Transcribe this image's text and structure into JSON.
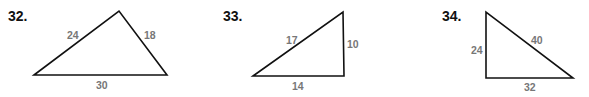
{
  "problems": [
    {
      "number": "32.",
      "sides": {
        "left": "24",
        "right": "18",
        "bottom": "30"
      }
    },
    {
      "number": "33.",
      "sides": {
        "hypotenuse": "17",
        "vertical": "10",
        "bottom": "14"
      }
    },
    {
      "number": "34.",
      "sides": {
        "vertical": "24",
        "hypotenuse": "40",
        "bottom": "32"
      }
    }
  ],
  "colors": {
    "line": "#111111",
    "label": "#777777",
    "number": "#111111"
  }
}
